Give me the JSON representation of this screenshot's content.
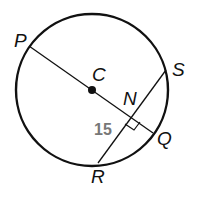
{
  "diagram": {
    "type": "circle-geometry",
    "points": {
      "P": {
        "label": "P"
      },
      "C": {
        "label": "C"
      },
      "N": {
        "label": "N"
      },
      "Q": {
        "label": "Q"
      },
      "S": {
        "label": "S"
      },
      "R": {
        "label": "R"
      }
    },
    "segments": [
      "PQ",
      "RS"
    ],
    "measure": {
      "label": "15",
      "segment": "RN"
    },
    "right_angle_at": "N"
  }
}
